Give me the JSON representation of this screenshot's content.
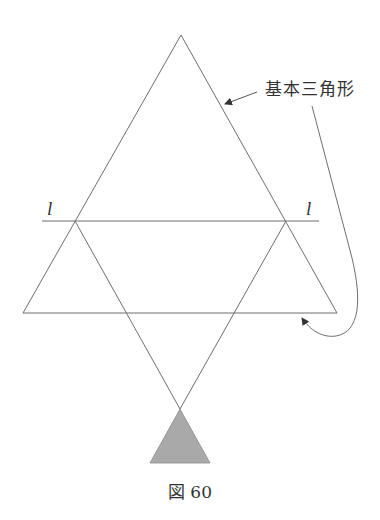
{
  "figure": {
    "caption": "図 60",
    "callout_label": "基本三角形",
    "line_label_left": "l",
    "line_label_right": "l"
  },
  "colors": {
    "line": "#6e6e6e",
    "shaded_fill": "#a9a9a9",
    "text": "#333333",
    "background": "#ffffff"
  },
  "geometry": {
    "basic_triangle": {
      "apex": [
        181,
        35
      ],
      "bottom_left": [
        23,
        313
      ],
      "bottom_right": [
        337,
        313
      ]
    },
    "line_l": {
      "y": 221,
      "x_start": 42,
      "x_end": 319
    },
    "lower_line": {
      "y": 313,
      "x_start": 23,
      "x_end": 337
    },
    "crossing_lines_meet": [
      180,
      409
    ],
    "shaded_triangle": {
      "apex": [
        180,
        409
      ],
      "bottom_left": [
        150,
        463
      ],
      "bottom_right": [
        210,
        463
      ]
    }
  }
}
